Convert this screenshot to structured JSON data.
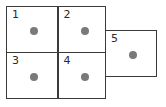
{
  "diagram": {
    "title": "",
    "background_color": "#ffffff",
    "border_color": "#3a3a3a",
    "dot_color": "#7a7a7a",
    "label_color": "#2b2b2b",
    "cells": [
      {
        "label": "1",
        "dot": "gray-dot"
      },
      {
        "label": "2",
        "dot": "gray-dot"
      },
      {
        "label": "3",
        "dot": "gray-dot"
      },
      {
        "label": "4",
        "dot": "gray-dot"
      },
      {
        "label": "5",
        "dot": "gray-dot"
      }
    ]
  }
}
